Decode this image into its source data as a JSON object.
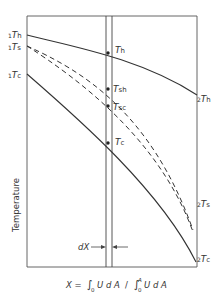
{
  "diagram": {
    "y_axis_label": "Temperature",
    "x_axis_formula": "X = ∫₀ U dA  /  ∫₀ᴬ U dA",
    "x_formula_parts": {
      "lhs": "X =",
      "num": "U d A",
      "sep": "/",
      "den": "U d A",
      "lower": "0",
      "upper": "A"
    },
    "dx_label": "dX",
    "left_labels": [
      {
        "pre": "1",
        "sym": "T",
        "sub": "h"
      },
      {
        "pre": "1",
        "sym": "T",
        "sub": "s"
      },
      {
        "pre": "1",
        "sym": "T",
        "sub": "c"
      }
    ],
    "right_labels": [
      {
        "pre": "2",
        "sym": "T",
        "sub": "h"
      },
      {
        "pre": "2",
        "sym": "T",
        "sub": "s"
      },
      {
        "pre": "2",
        "sym": "T",
        "sub": "c"
      }
    ],
    "mid_labels": [
      {
        "sym": "T",
        "sub": "h"
      },
      {
        "sym": "T",
        "sub": "sh"
      },
      {
        "sym": "T",
        "sub": "sc"
      },
      {
        "sym": "T",
        "sub": "c"
      }
    ],
    "curves": [
      {
        "name": "hot-fluid",
        "style": "solid"
      },
      {
        "name": "surface-hot",
        "style": "dashed"
      },
      {
        "name": "surface-cold",
        "style": "dashed"
      },
      {
        "name": "cold-fluid",
        "style": "solid"
      }
    ]
  }
}
